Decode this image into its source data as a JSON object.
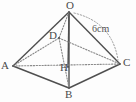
{
  "figure": {
    "kind": "geometry-diagram",
    "background_color": "#fdfdfd",
    "solid_edge_color": "#4f4f4f",
    "hidden_edge_color": "#8a8a8a",
    "arc_color": "#9a9a9a",
    "label_color": "#4a4a4a"
  },
  "vertices": [
    {
      "id": "O",
      "label": "O",
      "x": 69,
      "y": 12,
      "label_x": 66,
      "label_y": 0,
      "role": "apex"
    },
    {
      "id": "A",
      "label": "A",
      "x": 13,
      "y": 66,
      "label_x": 1,
      "label_y": 60,
      "role": "base-left"
    },
    {
      "id": "B",
      "label": "B",
      "x": 69,
      "y": 88,
      "label_x": 65,
      "label_y": 89,
      "role": "base-front"
    },
    {
      "id": "C",
      "label": "C",
      "x": 120,
      "y": 64,
      "label_x": 123,
      "label_y": 57,
      "role": "base-right"
    },
    {
      "id": "D",
      "label": "D",
      "x": 59,
      "y": 38,
      "label_x": 49,
      "label_y": 30,
      "role": "base-back-hidden"
    },
    {
      "id": "H",
      "label": "H",
      "x": 68,
      "y": 67,
      "label_x": 60,
      "label_y": 62,
      "role": "altitude-foot"
    }
  ],
  "edges": [
    {
      "id": "OA",
      "from": "O",
      "to": "A",
      "style": "solid",
      "name": "edge-o-a"
    },
    {
      "id": "OB",
      "from": "O",
      "to": "B",
      "style": "solid",
      "name": "edge-o-b"
    },
    {
      "id": "OC",
      "from": "O",
      "to": "C",
      "style": "solid",
      "name": "edge-o-c"
    },
    {
      "id": "AB",
      "from": "A",
      "to": "B",
      "style": "solid",
      "name": "edge-a-b"
    },
    {
      "id": "BC",
      "from": "B",
      "to": "C",
      "style": "solid",
      "name": "edge-b-c"
    },
    {
      "id": "OD",
      "from": "O",
      "to": "D",
      "style": "dotted",
      "name": "edge-o-d-hidden"
    },
    {
      "id": "AD",
      "from": "A",
      "to": "D",
      "style": "dotted",
      "name": "edge-a-d-hidden"
    },
    {
      "id": "DC",
      "from": "D",
      "to": "C",
      "style": "dotted",
      "name": "edge-d-c-hidden"
    },
    {
      "id": "AC",
      "from": "A",
      "to": "C",
      "style": "dotted",
      "name": "diagonal-a-c-hidden"
    },
    {
      "id": "DB",
      "from": "D",
      "to": "B",
      "style": "dotted",
      "name": "diagonal-d-b-hidden"
    },
    {
      "id": "OH",
      "from": "O",
      "to": "H",
      "style": "solid",
      "name": "altitude-o-h"
    }
  ],
  "annotations": {
    "measure": {
      "text": "6cm",
      "x": 92,
      "y": 24,
      "refers_to": "OC",
      "arc": {
        "start_x": 74,
        "start_y": 13,
        "ctrl_x": 112,
        "ctrl_y": 22,
        "end_x": 118,
        "end_y": 60,
        "style": "dotted"
      }
    }
  }
}
